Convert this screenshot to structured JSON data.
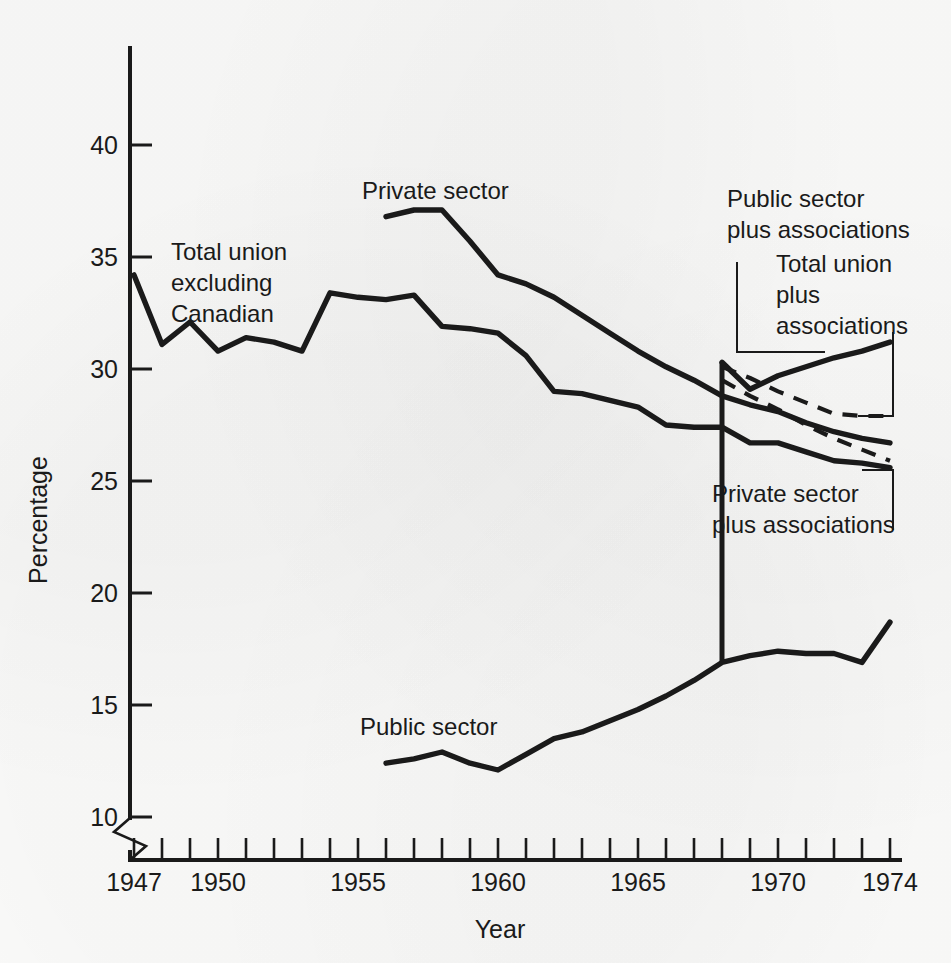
{
  "chart_data": {
    "type": "line",
    "title": "",
    "xlabel": "Year",
    "ylabel": "Percentage",
    "xlim": [
      1947,
      1975
    ],
    "ylim": [
      10,
      41.5
    ],
    "yticks": [
      10,
      15,
      20,
      25,
      30,
      35,
      40
    ],
    "ytick_labels": [
      "10",
      "15",
      "20",
      "25",
      "30",
      "35",
      "40"
    ],
    "xticks": [
      1947,
      1948,
      1949,
      1950,
      1951,
      1952,
      1953,
      1954,
      1955,
      1956,
      1957,
      1958,
      1959,
      1960,
      1961,
      1962,
      1963,
      1964,
      1965,
      1966,
      1967,
      1968,
      1969,
      1970,
      1971,
      1972,
      1973,
      1974
    ],
    "xtick_labels_shown": [
      "1947",
      "1950",
      "1955",
      "1960",
      "1965",
      "1970",
      "1974"
    ],
    "xtick_labels_values": [
      1947,
      1950,
      1955,
      1960,
      1965,
      1970,
      1974
    ],
    "grid": false,
    "legend": "inline annotations",
    "axis_break": true,
    "axis_break_note": "y-axis broken below 10",
    "series": [
      {
        "name": "Total union excluding Canadian",
        "style": "solid",
        "x": [
          1947,
          1948,
          1949,
          1950,
          1951,
          1952,
          1953,
          1954,
          1955,
          1956,
          1957,
          1958,
          1959,
          1960,
          1961,
          1962,
          1963,
          1964,
          1965,
          1966,
          1967,
          1968,
          1969,
          1970,
          1971,
          1972,
          1973,
          1974
        ],
        "values": [
          34.2,
          31.1,
          32.1,
          30.8,
          31.4,
          31.2,
          30.8,
          33.4,
          33.2,
          33.1,
          33.3,
          31.9,
          31.8,
          31.6,
          30.6,
          29.0,
          28.9,
          28.6,
          28.3,
          27.5,
          27.4,
          27.4,
          26.7,
          26.7,
          26.3,
          25.9,
          25.8,
          25.6
        ]
      },
      {
        "name": "Private sector",
        "style": "solid",
        "x": [
          1956,
          1957,
          1958,
          1959,
          1960,
          1961,
          1962,
          1963,
          1964,
          1965,
          1966,
          1967,
          1968,
          1969,
          1970,
          1971,
          1972,
          1973,
          1974
        ],
        "values": [
          36.8,
          37.1,
          37.1,
          35.7,
          34.2,
          33.8,
          33.2,
          32.4,
          31.6,
          30.8,
          30.1,
          29.5,
          28.8,
          28.4,
          28.1,
          27.6,
          27.2,
          26.9,
          26.7
        ]
      },
      {
        "name": "Public sector",
        "style": "solid",
        "x": [
          1956,
          1957,
          1958,
          1959,
          1960,
          1961,
          1962,
          1963,
          1964,
          1965,
          1966,
          1967,
          1968,
          1969,
          1970,
          1971,
          1972,
          1973,
          1974
        ],
        "values": [
          12.4,
          12.6,
          12.9,
          12.4,
          12.1,
          12.8,
          13.5,
          13.8,
          14.3,
          14.8,
          15.4,
          16.1,
          16.9,
          17.2,
          17.4,
          17.3,
          17.3,
          16.9,
          18.7
        ]
      },
      {
        "name": "Public sector plus associations",
        "style": "solid",
        "x": [
          1968,
          1969,
          1970,
          1971,
          1972,
          1973,
          1974
        ],
        "values": [
          30.3,
          29.1,
          29.7,
          30.1,
          30.5,
          30.8,
          31.2
        ]
      },
      {
        "name": "Total union plus associations",
        "style": "dashed",
        "x": [
          1968,
          1969,
          1970,
          1971,
          1972,
          1973,
          1974
        ],
        "values": [
          30.1,
          29.6,
          29.0,
          28.5,
          28.0,
          27.9,
          27.9
        ]
      },
      {
        "name": "Private sector plus associations",
        "style": "dashed",
        "x": [
          1968,
          1969,
          1970,
          1971,
          1972,
          1973,
          1974
        ],
        "values": [
          29.5,
          28.8,
          28.2,
          27.5,
          26.9,
          26.4,
          25.9
        ]
      }
    ],
    "connector": {
      "name": "public-sector-to-public-plus-associations",
      "x": 1968,
      "y_from": 16.9,
      "y_to": 30.3
    },
    "annotations": [
      {
        "id": "total-union-excluding-canadian",
        "text": "Total union\nexcluding\nCanadian",
        "lines": [
          "Total union",
          "excluding",
          "Canadian"
        ]
      },
      {
        "id": "private-sector",
        "text": "Private sector",
        "lines": [
          "Private sector"
        ]
      },
      {
        "id": "public-sector",
        "text": "Public sector",
        "lines": [
          "Public sector"
        ]
      },
      {
        "id": "public-sector-plus-associations",
        "text": "Public sector plus associations",
        "lines": [
          "Public sector",
          "plus associations"
        ]
      },
      {
        "id": "total-union-plus-associations",
        "text": "Total union plus associations",
        "lines": [
          "Total union",
          "plus",
          "associations"
        ]
      },
      {
        "id": "private-sector-plus-associations",
        "text": "Private sector plus associations",
        "lines": [
          "Private sector",
          "plus associations"
        ]
      }
    ],
    "colors": {
      "ink": "#1a1a1a",
      "paper": "#fbfbfa"
    }
  },
  "axes": {
    "y_label": "Percentage",
    "x_label": "Year",
    "y_tick_0": "10",
    "y_tick_1": "15",
    "y_tick_2": "20",
    "y_tick_3": "25",
    "y_tick_4": "30",
    "y_tick_5": "35",
    "y_tick_6": "40",
    "x_tick_0": "1947",
    "x_tick_1": "1950",
    "x_tick_2": "1955",
    "x_tick_3": "1960",
    "x_tick_4": "1965",
    "x_tick_5": "1970",
    "x_tick_6": "1974"
  },
  "labels": {
    "total_union_l1": "Total union",
    "total_union_l2": "excluding",
    "total_union_l3": "Canadian",
    "private_sector": "Private sector",
    "public_sector": "Public sector",
    "public_plus_l1": "Public sector",
    "public_plus_l2": "plus associations",
    "total_plus_l1": "Total union",
    "total_plus_l2": "plus",
    "total_plus_l3": "associations",
    "private_plus_l1": "Private sector",
    "private_plus_l2": "plus associations"
  }
}
